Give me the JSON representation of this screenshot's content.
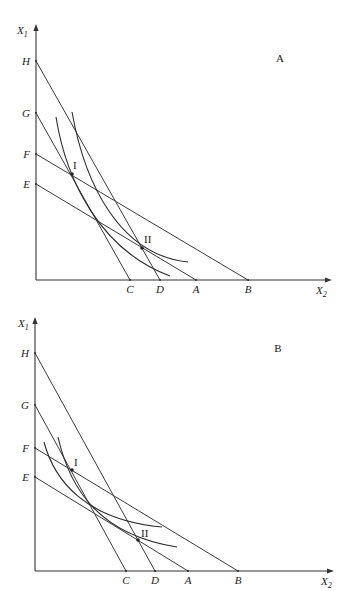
{
  "figure": {
    "width": 350,
    "height": 591,
    "background": "#ffffff",
    "line_color": "#3a3a3a"
  },
  "panels": [
    {
      "id": "panel-a",
      "title": "A",
      "title_pos": [
        280,
        62
      ],
      "axes": {
        "origin": [
          36,
          280
        ],
        "y_top": 24,
        "x_end": 332,
        "y_label": {
          "main": "X",
          "sub": "1",
          "pos": [
            17,
            34
          ]
        },
        "x_label": {
          "main": "X",
          "sub": "2",
          "pos": [
            316,
            294
          ]
        }
      },
      "y_intercepts": [
        {
          "name": "H",
          "y": 61
        },
        {
          "name": "G",
          "y": 113
        },
        {
          "name": "F",
          "y": 154
        },
        {
          "name": "E",
          "y": 184
        }
      ],
      "x_intercepts": [
        {
          "name": "C",
          "x": 130
        },
        {
          "name": "D",
          "x": 160
        },
        {
          "name": "A",
          "x": 196
        },
        {
          "name": "B",
          "x": 248
        }
      ],
      "budget_lines": [
        {
          "from": "H",
          "to": "D"
        },
        {
          "from": "G",
          "to": "C"
        },
        {
          "from": "F",
          "to": "B"
        },
        {
          "from": "E",
          "to": "A"
        }
      ],
      "indifference_curves": [
        {
          "through": "I",
          "d": "M56,117 C66,180 100,250 170,276"
        },
        {
          "through": "II",
          "d": "M72,112 C85,185 120,255 188,262"
        }
      ],
      "points": [
        {
          "label": "I",
          "x": 72,
          "y": 174,
          "label_pos": [
            73,
            169
          ]
        },
        {
          "label": "II",
          "x": 142,
          "y": 248,
          "label_pos": [
            144,
            243
          ]
        }
      ]
    },
    {
      "id": "panel-b",
      "title": "B",
      "title_pos": [
        278,
        352
      ],
      "axes": {
        "origin": [
          35,
          571
        ],
        "y_top": 317,
        "x_end": 334,
        "y_label": {
          "main": "X",
          "sub": "1",
          "pos": [
            18,
            327
          ]
        },
        "x_label": {
          "main": "X",
          "sub": "2",
          "pos": [
            321,
            585
          ]
        }
      },
      "y_intercepts": [
        {
          "name": "H",
          "y": 353
        },
        {
          "name": "G",
          "y": 405
        },
        {
          "name": "F",
          "y": 448
        },
        {
          "name": "E",
          "y": 477
        }
      ],
      "x_intercepts": [
        {
          "name": "C",
          "x": 126
        },
        {
          "name": "D",
          "x": 155
        },
        {
          "name": "A",
          "x": 188
        },
        {
          "name": "B",
          "x": 238
        }
      ],
      "budget_lines": [
        {
          "from": "H",
          "to": "D"
        },
        {
          "from": "G",
          "to": "C"
        },
        {
          "from": "F",
          "to": "B"
        },
        {
          "from": "E",
          "to": "A"
        }
      ],
      "indifference_curves": [
        {
          "through": "I-II",
          "d": "M58,437 C70,490 100,535 177,547"
        },
        {
          "through": "none",
          "d": "M44,442 C54,480 85,520 162,527"
        }
      ],
      "points": [
        {
          "label": "I",
          "x": 72,
          "y": 470,
          "label_pos": [
            74,
            466
          ]
        },
        {
          "label": "II",
          "x": 138,
          "y": 540,
          "label_pos": [
            141,
            537
          ]
        }
      ]
    }
  ]
}
